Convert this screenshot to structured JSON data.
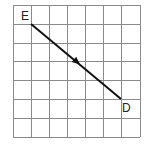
{
  "diagram": {
    "type": "grid-vector",
    "grid": {
      "columns": 7,
      "rows": 7,
      "x_lines": [
        13,
        31,
        49,
        67,
        85,
        103,
        121,
        140
      ],
      "y_lines": [
        5,
        24,
        43,
        61,
        80,
        99,
        118,
        137
      ],
      "line_color": "#8a8a8a"
    },
    "vector": {
      "from_label": "E",
      "to_label": "D",
      "from": {
        "x": 31,
        "y": 24
      },
      "to": {
        "x": 121,
        "y": 99
      },
      "arrow_at": {
        "x": 77,
        "y": 62
      },
      "color": "#111111"
    },
    "labels": [
      {
        "text": "E",
        "x": 21,
        "y": 20
      },
      {
        "text": "D",
        "x": 122,
        "y": 112
      }
    ]
  }
}
